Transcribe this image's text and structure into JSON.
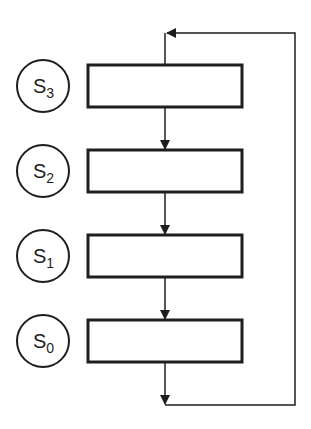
{
  "diagram": {
    "type": "cyclic-flow",
    "stroke_color": "#1e1e1e",
    "background": "#ffffff",
    "states": [
      {
        "label": "S",
        "subscript": "3",
        "cy": 86
      },
      {
        "label": "S",
        "subscript": "2",
        "cy": 171
      },
      {
        "label": "S",
        "subscript": "1",
        "cy": 256
      },
      {
        "label": "S",
        "subscript": "0",
        "cy": 341
      }
    ],
    "boxes": [
      {
        "top": 65,
        "text": ""
      },
      {
        "top": 150,
        "text": ""
      },
      {
        "top": 235,
        "text": ""
      },
      {
        "top": 320,
        "text": ""
      }
    ],
    "flow": "S3 → S2 → S1 → S0 → back to S3 (feedback loop on right)"
  }
}
